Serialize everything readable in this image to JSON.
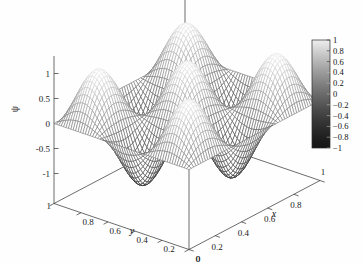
{
  "figure": {
    "kind": "surface-plot",
    "background": "#fefefe",
    "line_color": "#2b2b2b"
  },
  "axes": {
    "z": {
      "name": "ψ",
      "ticks": [
        "1",
        "0.5",
        "0",
        "-0.5",
        "-1"
      ],
      "values": [
        1,
        0.5,
        0,
        -0.5,
        -1
      ],
      "range": [
        -1,
        1
      ]
    },
    "x": {
      "name": "x",
      "ticks": [
        "0",
        "0.2",
        "0.4",
        "0.6",
        "0.8",
        "1"
      ],
      "values": [
        0,
        0.2,
        0.4,
        0.6,
        0.8,
        1
      ],
      "range": [
        0,
        1
      ]
    },
    "y": {
      "name": "y",
      "ticks": [
        "0",
        "0.2",
        "0.4",
        "0.6",
        "0.8",
        "1"
      ],
      "values": [
        0,
        0.2,
        0.4,
        0.6,
        0.8,
        1
      ],
      "range": [
        0,
        1
      ]
    }
  },
  "colorbar": {
    "ticks": [
      "1",
      "0.8",
      "0.6",
      "0.4",
      "0.2",
      "0",
      "−0.2",
      "−0.4",
      "−0.6",
      "−0.8",
      "−1"
    ],
    "values": [
      1,
      0.8,
      0.6,
      0.4,
      0.2,
      0,
      -0.2,
      -0.4,
      -0.6,
      -0.8,
      -1
    ],
    "range": [
      -1,
      1
    ],
    "colormap": "grayscale",
    "top_color": "#e8e8e8",
    "bottom_color": "#1a1512"
  },
  "chart_data": {
    "type": "surface",
    "title": "",
    "xlabel": "x",
    "ylabel": "y",
    "zlabel": "ψ",
    "xlim": [
      0,
      1
    ],
    "ylim": [
      0,
      1
    ],
    "zlim": [
      -1,
      1
    ],
    "grid": false,
    "legend": "colorbar-right",
    "function": "sin(3*pi*x)*sin(3*pi*y)",
    "mesh": {
      "nx": 61,
      "ny": 61,
      "style": "wireframe"
    },
    "peaks": 9
  }
}
